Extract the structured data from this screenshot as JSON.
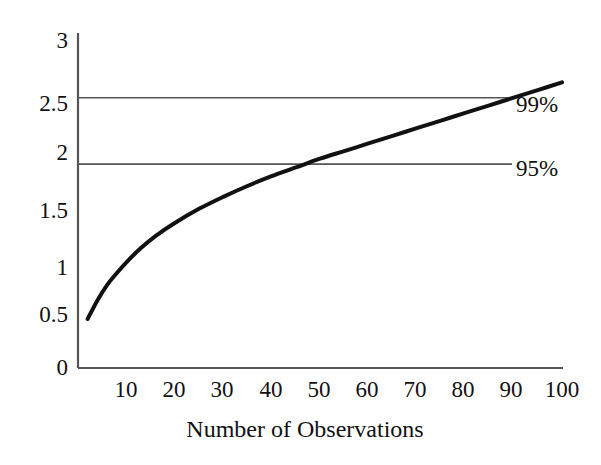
{
  "chart_data": {
    "type": "line",
    "title": "",
    "subtitle": "",
    "xlabel": "Number of Observations",
    "ylabel": "",
    "xlim": [
      0,
      103
    ],
    "ylim": [
      0,
      3.15
    ],
    "grid": false,
    "legend_position": "right-inline",
    "x_ticks": [
      "10",
      "20",
      "30",
      "40",
      "50",
      "60",
      "70",
      "80",
      "90",
      "100"
    ],
    "x_tick_values": [
      10,
      20,
      30,
      40,
      50,
      60,
      70,
      80,
      90,
      100
    ],
    "y_ticks": [
      "0",
      "0.5",
      "1",
      "1.5",
      "2",
      "2.5",
      "3"
    ],
    "y_tick_values": [
      0,
      0.5,
      1,
      1.5,
      2,
      2.5,
      3
    ],
    "series": [
      {
        "name": "critical-value-curve",
        "color": "#111111",
        "line_width": 4,
        "x": [
          2,
          4,
          6,
          8,
          10,
          13,
          16,
          20,
          25,
          30,
          35,
          40,
          45,
          50,
          55,
          60,
          65,
          70,
          75,
          80,
          85,
          90,
          95,
          100
        ],
        "values": [
          0.45,
          0.62,
          0.76,
          0.87,
          0.97,
          1.1,
          1.21,
          1.33,
          1.46,
          1.57,
          1.67,
          1.76,
          1.84,
          1.92,
          1.99,
          2.06,
          2.13,
          2.2,
          2.27,
          2.34,
          2.41,
          2.48,
          2.55,
          2.62
        ]
      }
    ],
    "reference_lines": [
      {
        "name": "confidence-99",
        "label": "99%",
        "y": 2.48,
        "color": "#555555",
        "x_start": 0,
        "x_end": 100,
        "crosses_curve_at_x": 65
      },
      {
        "name": "confidence-95",
        "label": "95%",
        "y": 1.87,
        "color": "#555555",
        "x_start": 0,
        "x_end": 100,
        "crosses_curve_at_x": 37
      }
    ],
    "annotations": [
      {
        "text": "99%",
        "y": 2.48
      },
      {
        "text": "95%",
        "y": 1.87
      }
    ]
  },
  "axes": {
    "x_axis_name": "x-axis",
    "y_axis_name": "y-axis",
    "axis_color": "#555555"
  }
}
